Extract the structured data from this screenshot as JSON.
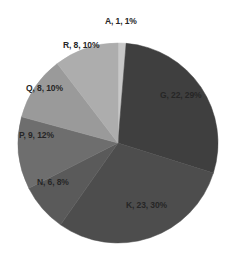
{
  "chart_data": {
    "type": "pie",
    "title": "",
    "legend_position": "none",
    "labels_inside": true,
    "label_format": "category, value, percent",
    "start_angle_deg": 0,
    "direction": "clockwise",
    "total": 77,
    "categories": [
      "A",
      "G",
      "K",
      "N",
      "P",
      "Q",
      "R"
    ],
    "values": [
      1,
      22,
      23,
      6,
      9,
      8,
      8
    ],
    "percents": [
      1,
      29,
      30,
      8,
      12,
      10,
      10
    ],
    "colors": [
      "#c8c8c8",
      "#3f3f3f",
      "#4d4d4d",
      "#5a5a5a",
      "#6e6e6e",
      "#9a9a9a",
      "#adadad"
    ],
    "slices": [
      {
        "name": "A",
        "value": 1,
        "percent": 1,
        "label": "A, 1, 1%",
        "color": "#c8c8c8"
      },
      {
        "name": "G",
        "value": 22,
        "percent": 29,
        "label": "G, 22, 29%",
        "color": "#3f3f3f"
      },
      {
        "name": "K",
        "value": 23,
        "percent": 30,
        "label": "K, 23, 30%",
        "color": "#4d4d4d"
      },
      {
        "name": "N",
        "value": 6,
        "percent": 8,
        "label": "N, 6, 8%",
        "color": "#5a5a5a"
      },
      {
        "name": "P",
        "value": 9,
        "percent": 12,
        "label": "P, 9, 12%",
        "color": "#6e6e6e"
      },
      {
        "name": "Q",
        "value": 8,
        "percent": 10,
        "label": "Q, 8, 10%",
        "color": "#9a9a9a"
      },
      {
        "name": "R",
        "value": 8,
        "percent": 10,
        "label": "R, 8, 10%",
        "color": "#adadad"
      }
    ],
    "xlabel": "",
    "ylabel": ""
  },
  "labels": {
    "a": "A, 1, 1%",
    "g": "G, 22, 29%",
    "k": "K, 23, 30%",
    "n": "N, 6, 8%",
    "p": "P, 9, 12%",
    "q": "Q, 8, 10%",
    "r": "R, 8, 10%"
  }
}
